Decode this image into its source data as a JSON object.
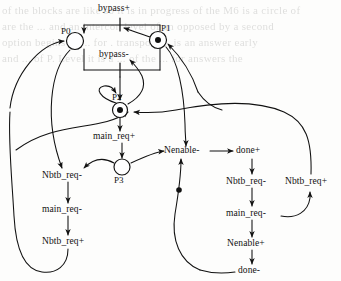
{
  "figure": {
    "kind": "petri-net-stg",
    "caption": "",
    "background_bleed_text": [
      "of the blocks are like so it is in progress of the M6 is a circle of",
      "are the ...  and an intercon level of an opposed by  a second",
      "option begins of  ... for    . transport  ...  is an answer  early",
      "and  ... of  P. Level  it  is  a  ...  of  the  ...  for answers  the"
    ],
    "places": [
      {
        "id": "P0",
        "label": "P0",
        "cx": 75,
        "cy": 41,
        "r": 8.5,
        "tokens": 0
      },
      {
        "id": "P1",
        "label": "P1",
        "cx": 158,
        "cy": 40,
        "r": 8.5,
        "tokens": 1
      },
      {
        "id": "P2",
        "label": "P2",
        "cx": 120,
        "cy": 110,
        "r": 7.5,
        "tokens": 1
      },
      {
        "id": "P3",
        "label": "P3",
        "cx": 122,
        "cy": 167,
        "r": 8.0,
        "tokens": 0
      }
    ],
    "transitions": [
      {
        "id": "t-bypass-plus",
        "label": "bypass+",
        "x": 120,
        "y": 12,
        "align": "center"
      },
      {
        "id": "t-bypass-minus",
        "label": "bypass-",
        "x": 120,
        "y": 56,
        "align": "center"
      },
      {
        "id": "t-main-req-plus",
        "label": "main_req+",
        "x": 122,
        "y": 138,
        "align": "center"
      },
      {
        "id": "t-nbtb-req-minus-left",
        "label": "Nbtb_req-",
        "x": 68,
        "y": 177,
        "align": "center"
      },
      {
        "id": "t-main-req-minus-left",
        "label": "main_req-",
        "x": 68,
        "y": 211,
        "align": "center"
      },
      {
        "id": "t-nbtb-req-plus-left",
        "label": "Nbtb_req+",
        "x": 68,
        "y": 243,
        "align": "center"
      },
      {
        "id": "t-nenable-minus",
        "label": "Nenable-",
        "x": 187,
        "y": 155,
        "align": "center"
      },
      {
        "id": "t-done-plus",
        "label": "done+",
        "x": 252,
        "y": 155,
        "align": "center"
      },
      {
        "id": "t-nbtb-req-minus-right",
        "label": "Nbtb_req-",
        "x": 252,
        "y": 183,
        "align": "center"
      },
      {
        "id": "t-main-req-minus-right",
        "label": "main_req-",
        "x": 252,
        "y": 215,
        "align": "center"
      },
      {
        "id": "t-nenable-plus",
        "label": "Nenable+",
        "x": 252,
        "y": 245,
        "align": "center"
      },
      {
        "id": "t-done-minus",
        "label": "done-",
        "x": 252,
        "y": 272,
        "align": "center"
      },
      {
        "id": "t-nbtb-req-plus-right",
        "label": "Nbtb_req+",
        "x": 311,
        "y": 183,
        "align": "center"
      }
    ],
    "arc_token": {
      "cx": 179,
      "cy": 190,
      "r": 2.6
    },
    "colors": {
      "ink": "#111111",
      "paper": "#fdfdfc",
      "bleed": "#4a4a48"
    }
  }
}
